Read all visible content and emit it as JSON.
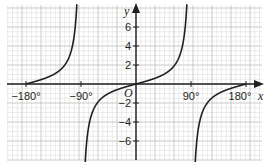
{
  "chart_data": {
    "type": "line",
    "title": "",
    "function": "y = tan x",
    "xlabel": "x",
    "ylabel": "y",
    "origin_label": "O",
    "xlim": [
      -200,
      200
    ],
    "ylim": [
      -8,
      8
    ],
    "x_ticks": [
      {
        "value": -180,
        "label": "−180°"
      },
      {
        "value": -90,
        "label": "−90°"
      },
      {
        "value": 90,
        "label": "90°"
      },
      {
        "value": 180,
        "label": "180°"
      }
    ],
    "y_ticks": [
      {
        "value": 6,
        "label": "6"
      },
      {
        "value": 4,
        "label": "4"
      },
      {
        "value": 2,
        "label": "2"
      },
      {
        "value": -2,
        "label": "−2"
      },
      {
        "value": -4,
        "label": "−4"
      },
      {
        "value": -6,
        "label": "−6"
      }
    ],
    "asymptotes_x": [
      -90,
      90
    ],
    "grid": true,
    "legend": null,
    "series": [
      {
        "name": "tan x branch (-180° to -90°)",
        "x": [
          -180,
          -150,
          -135,
          -120,
          -105,
          -95
        ],
        "y": [
          0,
          0.58,
          1,
          1.73,
          3.73,
          11.43
        ]
      },
      {
        "name": "tan x branch (-90° to 90°)",
        "x": [
          -85,
          -75,
          -60,
          -45,
          -30,
          0,
          30,
          45,
          60,
          75,
          85
        ],
        "y": [
          -11.43,
          -3.73,
          -1.73,
          -1,
          -0.58,
          0,
          0.58,
          1,
          1.73,
          3.73,
          11.43
        ]
      },
      {
        "name": "tan x branch (90° to 180°)",
        "x": [
          95,
          105,
          120,
          135,
          150,
          180
        ],
        "y": [
          -11.43,
          -3.73,
          -1.73,
          -1,
          -0.58,
          0
        ]
      }
    ],
    "colors": {
      "curve": "#231f20",
      "axis": "#231f20",
      "grid_minor": "#d9d9d9",
      "grid_major": "#bdbdbd"
    }
  }
}
